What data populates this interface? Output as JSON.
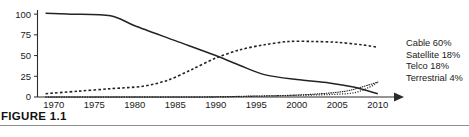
{
  "figure": {
    "caption": "FIGURE 1.1"
  },
  "legend": {
    "position": "right",
    "entries": [
      {
        "label": "Cable 60%"
      },
      {
        "label": "Satellite 18%"
      },
      {
        "label": "Telco 18%"
      },
      {
        "label": "Terrestrial 4%"
      }
    ]
  },
  "chart_data": {
    "type": "line",
    "title": "",
    "xlabel": "",
    "ylabel": "",
    "xlim": [
      1968,
      2012
    ],
    "ylim": [
      0,
      105
    ],
    "grid": false,
    "legend_position": "right",
    "x_ticks": [
      1970,
      1975,
      1980,
      1985,
      1990,
      1995,
      2000,
      2005,
      2010
    ],
    "y_ticks": [
      0,
      25,
      50,
      75,
      100
    ],
    "x_axis_arrow": true,
    "series": [
      {
        "name": "Terrestrial",
        "style": "solid",
        "end_label": "Terrestrial 4%",
        "x": [
          1969,
          1972,
          1977,
          1980,
          1985,
          1990,
          1993,
          1996,
          2000,
          2004,
          2007,
          2010
        ],
        "values": [
          101,
          100,
          98,
          86,
          68,
          50,
          38,
          27,
          21,
          17,
          12,
          4
        ]
      },
      {
        "name": "Cable",
        "style": "dashed",
        "end_label": "Cable 60%",
        "x": [
          1969,
          1973,
          1977,
          1981,
          1984,
          1987,
          1990,
          1993,
          1996,
          1999,
          2002,
          2005,
          2008,
          2010
        ],
        "values": [
          4,
          7,
          10,
          13,
          20,
          33,
          47,
          57,
          63,
          67,
          67,
          66,
          63,
          60
        ]
      },
      {
        "name": "Telco",
        "style": "fine-dashed",
        "end_label": "Telco 18%",
        "x": [
          1969,
          1980,
          1990,
          1995,
          2000,
          2004,
          2007,
          2009,
          2010
        ],
        "values": [
          0,
          0,
          0,
          1,
          2,
          3,
          5,
          12,
          18
        ]
      },
      {
        "name": "Satellite",
        "style": "dotted",
        "end_label": "Satellite 18%",
        "x": [
          1969,
          1980,
          1988,
          1994,
          1999,
          2003,
          2006,
          2008,
          2010
        ],
        "values": [
          0,
          0,
          0,
          1,
          2,
          4,
          7,
          12,
          18
        ]
      }
    ]
  }
}
